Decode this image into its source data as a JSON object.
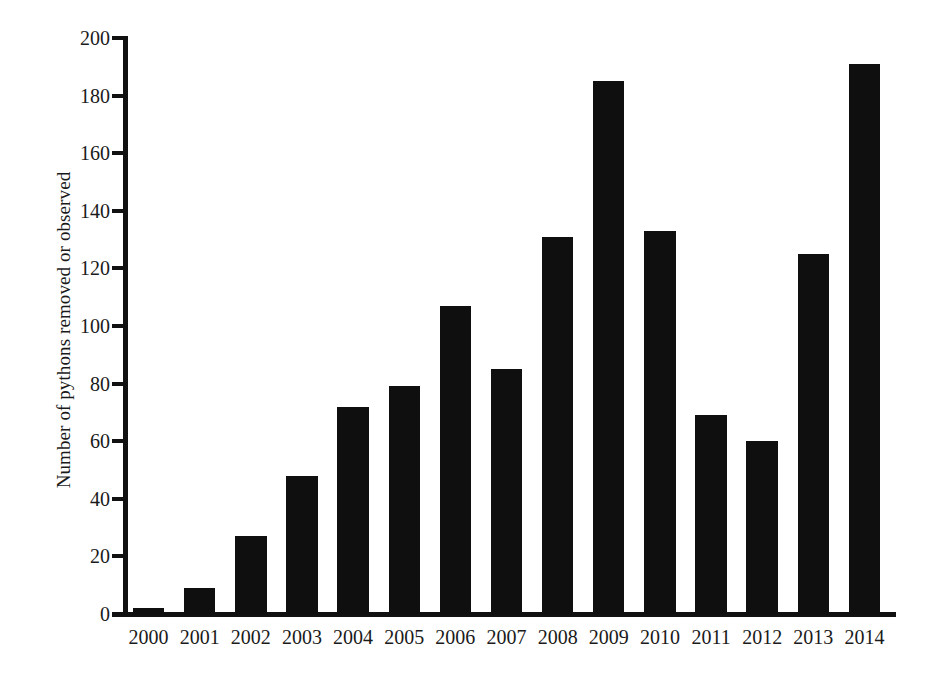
{
  "chart_data": {
    "type": "bar",
    "title": "",
    "subtitle": "",
    "xlabel": "",
    "ylabel": "Number of pythons removed or observed",
    "categories": [
      "2000",
      "2001",
      "2002",
      "2003",
      "2004",
      "2005",
      "2006",
      "2007",
      "2008",
      "2009",
      "2010",
      "2011",
      "2012",
      "2013",
      "2014"
    ],
    "values": [
      2,
      9,
      27,
      48,
      72,
      79,
      107,
      85,
      131,
      185,
      133,
      69,
      60,
      125,
      191
    ],
    "ylim": [
      0,
      200
    ],
    "ytick_step": 20,
    "yticks": [
      0,
      20,
      40,
      60,
      80,
      100,
      120,
      140,
      160,
      180,
      200
    ],
    "ytick_labels": [
      "0",
      "20",
      "40",
      "60",
      "80",
      "100",
      "120",
      "140",
      "160",
      "180",
      "200"
    ],
    "grid": false,
    "legend": false,
    "legend_position": "none",
    "bar_color": "#100f0f",
    "axis_color": "#111111",
    "text_color": "#1a1a1a",
    "background_color": "#ffffff"
  }
}
